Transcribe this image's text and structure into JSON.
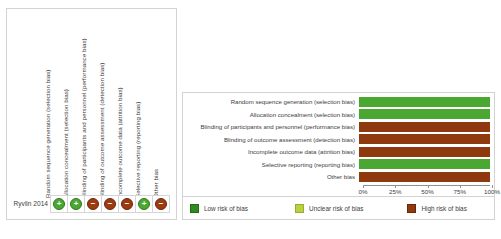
{
  "figure": {
    "caption_partial": ""
  },
  "summary_panel": {
    "name": "risk-of-bias-summary",
    "domains": [
      "Random sequence generation (selection bias)",
      "Allocation concealment (selection bias)",
      "Blinding of participants and personnel (performance bias)",
      "Blinding of outcome assessment (detection bias)",
      "Incomplete outcome data (attrition bias)",
      "Selective reporting (reporting bias)",
      "Other bias"
    ],
    "studies": [
      {
        "label": "Ryvlin 2014",
        "judgements": [
          "low",
          "low",
          "high",
          "high",
          "high",
          "low",
          "high"
        ],
        "symbols": [
          "+",
          "+",
          "−",
          "−",
          "−",
          "+",
          "−"
        ]
      }
    ]
  },
  "graph_panel": {
    "name": "risk-of-bias-graph",
    "axis": {
      "ticks": [
        "0%",
        "25%",
        "50%",
        "75%",
        "100%"
      ],
      "values": [
        0,
        25,
        50,
        75,
        100
      ]
    },
    "legend": [
      {
        "key": "low",
        "label": "Low risk of bias",
        "color": "#2f8b1e"
      },
      {
        "key": "unclear",
        "label": "Unclear risk of bias",
        "color": "#b9d13e"
      },
      {
        "key": "high",
        "label": "High risk of bias",
        "color": "#8f3a0e"
      }
    ]
  },
  "chart_data": {
    "type": "bar",
    "orientation": "horizontal",
    "stacked": true,
    "title": "",
    "xlabel": "",
    "ylabel": "",
    "xlim": [
      0,
      100
    ],
    "grid": false,
    "legend_position": "bottom",
    "categories": [
      "Random sequence generation (selection bias)",
      "Allocation concealment (selection bias)",
      "Blinding of participants and personnel (performance bias)",
      "Blinding of outcome assessment (detection bias)",
      "Incomplete outcome data (attrition bias)",
      "Selective reporting (reporting bias)",
      "Other bias"
    ],
    "series": [
      {
        "name": "Low risk of bias",
        "color": "#4aa832",
        "values": [
          100,
          100,
          0,
          0,
          0,
          100,
          0
        ]
      },
      {
        "name": "Unclear risk of bias",
        "color": "#c8d94a",
        "values": [
          0,
          0,
          0,
          0,
          0,
          0,
          0
        ]
      },
      {
        "name": "High risk of bias",
        "color": "#8f3a0e",
        "values": [
          0,
          0,
          100,
          100,
          100,
          0,
          100
        ]
      }
    ],
    "tick_labels": [
      "0%",
      "25%",
      "50%",
      "75%",
      "100%"
    ]
  }
}
